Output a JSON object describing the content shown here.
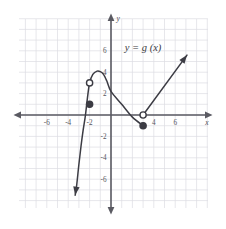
{
  "figure": {
    "title": "",
    "function_label": "y = g (x)",
    "axis_label_x": "x",
    "axis_label_y": "y",
    "colors": {
      "grid": "#dcdce2",
      "axis": "#5a5a62",
      "curve": "#3c3c44",
      "text": "#55555c",
      "background": "#ffffff"
    }
  },
  "chart_data": {
    "type": "line",
    "title": "",
    "subtitle": "",
    "xlabel": "x",
    "ylabel": "y",
    "legend": [
      "y = g (x)"
    ],
    "legend_position": "top-right",
    "grid": true,
    "xlim": [
      -8,
      8
    ],
    "ylim": [
      -8,
      8
    ],
    "xticks": [
      -6,
      -4,
      -2,
      4,
      6
    ],
    "yticks": [
      6,
      4,
      2,
      -2,
      -4,
      -6
    ],
    "xtick_labels": [
      "-6",
      "-4",
      "-2",
      "4",
      "6"
    ],
    "ytick_labels": [
      "6",
      "4",
      "2",
      "-2",
      "-4",
      "-6"
    ],
    "tick_step": 2,
    "minor_grid_step": 1,
    "annotations": [
      {
        "text": "y = g (x)",
        "x": 3.0,
        "y": 6.0
      }
    ],
    "series": [
      {
        "name": "branch-left-parabola",
        "type": "line",
        "style": "solid",
        "arrow_start": true,
        "arrow_end": false,
        "points": [
          {
            "x": -3.35,
            "y": -7.5
          },
          {
            "x": -3.2,
            "y": -6.5
          },
          {
            "x": -3.0,
            "y": -4.6
          },
          {
            "x": -2.8,
            "y": -2.9
          },
          {
            "x": -2.6,
            "y": -1.4
          },
          {
            "x": -2.4,
            "y": -0.1
          },
          {
            "x": -2.2,
            "y": 1.6
          },
          {
            "x": -2.0,
            "y": 3.0
          },
          {
            "x": -1.7,
            "y": 3.8
          },
          {
            "x": -1.3,
            "y": 4.1
          },
          {
            "x": -1.0,
            "y": 4.05
          },
          {
            "x": -0.7,
            "y": 3.8
          },
          {
            "x": -0.4,
            "y": 3.2
          },
          {
            "x": 0.0,
            "y": 2.2
          },
          {
            "x": 1.0,
            "y": 1.0
          },
          {
            "x": 2.0,
            "y": -0.2
          },
          {
            "x": 3.0,
            "y": -1.0
          }
        ]
      },
      {
        "name": "branch-right-ray",
        "type": "line",
        "style": "solid",
        "arrow_start": false,
        "arrow_end": true,
        "points": [
          {
            "x": 3.0,
            "y": 0.0
          },
          {
            "x": 7.1,
            "y": 5.6
          }
        ]
      }
    ],
    "markers": [
      {
        "name": "open-circle-left",
        "x": -2.0,
        "y": 3.0,
        "filled": false
      },
      {
        "name": "closed-circle-left",
        "x": -2.0,
        "y": 1.0,
        "filled": true
      },
      {
        "name": "open-circle-right",
        "x": 3.0,
        "y": 0.0,
        "filled": false
      },
      {
        "name": "closed-circle-right",
        "x": 3.0,
        "y": -1.0,
        "filled": true
      }
    ]
  }
}
